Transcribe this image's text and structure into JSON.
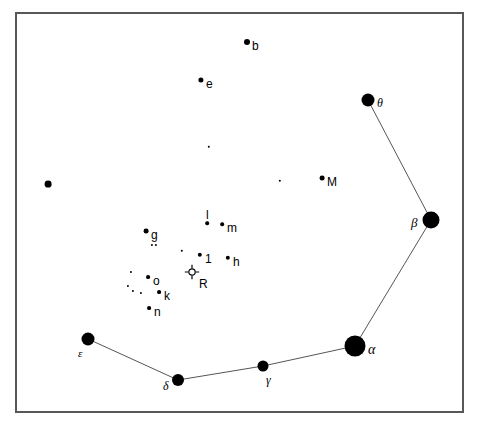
{
  "chart_data": {
    "type": "scatter",
    "title": "",
    "subtitle": "",
    "xlabel": "",
    "ylabel": "",
    "grid": false,
    "legend": "none",
    "xlim": [
      15,
      464
    ],
    "ylim": [
      12,
      413
    ],
    "frame": {
      "x": 15,
      "y": 12,
      "width": 449,
      "height": 401,
      "border_color": "#585858",
      "border_width": 2,
      "background": "#ffffff"
    },
    "point_color": "#000000",
    "line_color": "#555555",
    "stars": [
      {
        "id": "alpha",
        "label": "α",
        "label_script": "greek",
        "x": 355,
        "y": 346,
        "r": 10.5,
        "label_dx": 13,
        "label_dy": 4,
        "size": 14
      },
      {
        "id": "beta",
        "label": "β",
        "label_script": "greek",
        "x": 431,
        "y": 220,
        "r": 8.5,
        "label_dx": -20,
        "label_dy": 2,
        "size": 13
      },
      {
        "id": "gamma",
        "label": "γ",
        "label_script": "greek",
        "x": 263,
        "y": 366,
        "r": 5.5,
        "label_dx": 3,
        "label_dy": 14,
        "size": 12
      },
      {
        "id": "delta",
        "label": "δ",
        "label_script": "greek",
        "x": 178,
        "y": 380,
        "r": 6.0,
        "label_dx": -15,
        "label_dy": 6,
        "size": 12
      },
      {
        "id": "epsilon",
        "label": "ε",
        "label_script": "greek",
        "x": 88,
        "y": 339,
        "r": 6.5,
        "label_dx": -10,
        "label_dy": 14,
        "size": 11
      },
      {
        "id": "theta",
        "label": "θ",
        "label_script": "greek",
        "x": 368,
        "y": 100,
        "r": 6.5,
        "label_dx": 9,
        "label_dy": 3,
        "size": 12
      },
      {
        "id": "b",
        "label": "b",
        "label_script": "latin",
        "x": 247,
        "y": 42,
        "r": 3.0,
        "label_dx": 5,
        "label_dy": 4,
        "size": 12
      },
      {
        "id": "e",
        "label": "e",
        "label_script": "latin",
        "x": 201,
        "y": 80,
        "r": 2.6,
        "label_dx": 5,
        "label_dy": 4,
        "size": 12
      },
      {
        "id": "M",
        "label": "M",
        "label_script": "latin",
        "x": 322,
        "y": 178,
        "r": 2.4,
        "label_dx": 5,
        "label_dy": 4,
        "size": 12
      },
      {
        "id": "g",
        "label": "g",
        "label_script": "latin",
        "x": 146,
        "y": 231,
        "r": 2.4,
        "label_dx": 5,
        "label_dy": 4,
        "size": 12
      },
      {
        "id": "m",
        "label": "m",
        "label_script": "latin",
        "x": 222,
        "y": 224,
        "r": 1.8,
        "label_dx": 5,
        "label_dy": 4,
        "size": 12
      },
      {
        "id": "l",
        "label": "l",
        "label_script": "latin",
        "x": 207,
        "y": 223,
        "r": 1.8,
        "label_dx": -1,
        "label_dy": -8,
        "size": 12
      },
      {
        "id": "one",
        "label": "1",
        "label_script": "latin",
        "x": 200,
        "y": 255,
        "r": 2.2,
        "label_dx": 5,
        "label_dy": 4,
        "size": 12
      },
      {
        "id": "h",
        "label": "h",
        "label_script": "latin",
        "x": 228,
        "y": 258,
        "r": 2.2,
        "label_dx": 5,
        "label_dy": 4,
        "size": 12
      },
      {
        "id": "o",
        "label": "o",
        "label_script": "latin",
        "x": 148,
        "y": 277,
        "r": 1.9,
        "label_dx": 5,
        "label_dy": 4,
        "size": 12
      },
      {
        "id": "k",
        "label": "k",
        "label_script": "latin",
        "x": 159,
        "y": 292,
        "r": 1.9,
        "label_dx": 5,
        "label_dy": 4,
        "size": 12
      },
      {
        "id": "n",
        "label": "n",
        "label_script": "latin",
        "x": 149,
        "y": 308,
        "r": 1.9,
        "label_dx": 5,
        "label_dy": 4,
        "size": 12
      }
    ],
    "unlabeled_stars": [
      {
        "id": "u-west",
        "x": 48,
        "y": 184,
        "r": 3.4
      },
      {
        "id": "u-upper-mid",
        "x": 209,
        "y": 147,
        "r": 1.2
      },
      {
        "id": "u-near-M",
        "x": 280,
        "y": 181,
        "r": 1.2
      },
      {
        "id": "u-g-below-a",
        "x": 152,
        "y": 245,
        "r": 1.1
      },
      {
        "id": "u-g-below-b",
        "x": 156,
        "y": 245,
        "r": 1.1
      },
      {
        "id": "u-left-of-1",
        "x": 182,
        "y": 251,
        "r": 1.2
      },
      {
        "id": "u-o-left",
        "x": 131,
        "y": 272,
        "r": 1.1
      },
      {
        "id": "u-k-left-a",
        "x": 128,
        "y": 286,
        "r": 1.1
      },
      {
        "id": "u-k-left-b",
        "x": 133,
        "y": 291,
        "r": 1.1
      },
      {
        "id": "u-k-left-c",
        "x": 141,
        "y": 293,
        "r": 1.1
      }
    ],
    "variable_star": {
      "id": "R",
      "label": "R",
      "label_script": "latin",
      "x": 192,
      "y": 274,
      "circle_r": 3.2,
      "tick_len": 4,
      "label_dx": 7,
      "label_dy": 10,
      "size": 12
    },
    "constellation_lines": [
      {
        "from": "theta",
        "to": "beta"
      },
      {
        "from": "beta",
        "to": "alpha"
      },
      {
        "from": "alpha",
        "to": "gamma"
      },
      {
        "from": "gamma",
        "to": "delta"
      },
      {
        "from": "delta",
        "to": "epsilon"
      }
    ]
  }
}
